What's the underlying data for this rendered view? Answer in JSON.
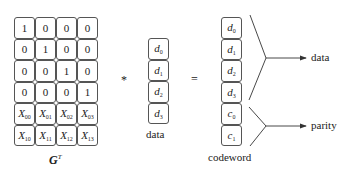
{
  "matrix": {
    "label": "G",
    "superscript": "T",
    "rows": [
      [
        "1",
        "0",
        "0",
        "0"
      ],
      [
        "0",
        "1",
        "0",
        "0"
      ],
      [
        "0",
        "0",
        "1",
        "0"
      ],
      [
        "0",
        "0",
        "0",
        "1"
      ],
      [
        {
          "v": "X",
          "s": "00"
        },
        {
          "v": "X",
          "s": "01"
        },
        {
          "v": "X",
          "s": "02"
        },
        {
          "v": "X",
          "s": "03"
        }
      ],
      [
        {
          "v": "X",
          "s": "10"
        },
        {
          "v": "X",
          "s": "11"
        },
        {
          "v": "X",
          "s": "12"
        },
        {
          "v": "X",
          "s": "13"
        }
      ]
    ]
  },
  "operators": {
    "multiply": "*",
    "equals": "="
  },
  "data_vector": {
    "label": "data",
    "items": [
      {
        "v": "d",
        "s": "0"
      },
      {
        "v": "d",
        "s": "1"
      },
      {
        "v": "d",
        "s": "2"
      },
      {
        "v": "d",
        "s": "3"
      }
    ]
  },
  "codeword_vector": {
    "label": "codeword",
    "items": [
      {
        "v": "d",
        "s": "0"
      },
      {
        "v": "d",
        "s": "1"
      },
      {
        "v": "d",
        "s": "2"
      },
      {
        "v": "d",
        "s": "3"
      },
      {
        "v": "c",
        "s": "0"
      },
      {
        "v": "c",
        "s": "1"
      }
    ]
  },
  "outputs": {
    "data_label": "data",
    "parity_label": "parity"
  }
}
